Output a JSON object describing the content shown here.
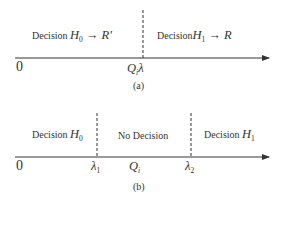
{
  "panel_a": {
    "left_label_prefix": "Decision ",
    "left_hyp": "H",
    "left_hyp_sub": "0",
    "left_arrow": " → ",
    "left_result": "R′",
    "right_label_prefix": "Decision",
    "right_hyp": "H",
    "right_hyp_sub": "1",
    "right_arrow": " → ",
    "right_result": "R",
    "origin": "0",
    "threshold_q": "Q",
    "threshold_q_sub": "i",
    "threshold_lambda": "λ",
    "caption": "(a)"
  },
  "panel_b": {
    "left_label_prefix": "Decision ",
    "left_hyp": "H",
    "left_hyp_sub": "0",
    "middle_label": "No Decision",
    "right_label_prefix": "Decision ",
    "right_hyp": "H",
    "right_hyp_sub": "1",
    "origin": "0",
    "lambda1": "λ",
    "lambda1_sub": "1",
    "q": "Q",
    "q_sub": "i",
    "lambda2": "λ",
    "lambda2_sub": "2",
    "caption": "(b)"
  }
}
